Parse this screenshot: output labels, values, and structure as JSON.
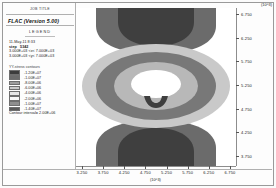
{
  "window": {
    "job_title": "JOB TITLE",
    "app_title": "FLAC (Version 5.00)"
  },
  "legend": {
    "heading": "LEGEND",
    "date": "11-May-11   8:33",
    "step_label": "step",
    "step_value": "5342",
    "xrange": "3.000E+03 <x<  7.000E+03",
    "yrange": "3.000E+03 <y<  7.000E+03",
    "colorbar_title": "YY-stress contours",
    "contour_interval": "Contour interval=  2.00E+06",
    "swatches": [
      {
        "color": "#3c3c3c",
        "label": "-1.20E+07"
      },
      {
        "color": "#6b6b6b",
        "label": "-1.00E+07"
      },
      {
        "color": "#9d9d9d",
        "label": "-8.00E+06"
      },
      {
        "color": "#c9c9c9",
        "label": "-6.00E+06"
      },
      {
        "color": "#e6e6e6",
        "label": "-4.00E+06"
      },
      {
        "color": "#f8f8f8",
        "label": "-2.00E+06"
      },
      {
        "color": "#8e8e8e",
        "label": "-1.00E+07"
      },
      {
        "color": "#5a5a5a",
        "label": "-1.40E+07"
      }
    ]
  },
  "chart_data": {
    "type": "heatmap",
    "title": "FLAC (Version 5.00)",
    "subtitle": "YY-stress contours",
    "xlabel": "",
    "ylabel": "",
    "x_multiplier": "(10^3)",
    "y_multiplier": "(10^3)",
    "xlim": [
      3.0,
      7.0
    ],
    "ylim": [
      3.5,
      7.0
    ],
    "xticks": [
      "3.250",
      "3.750",
      "4.250",
      "4.750",
      "5.250",
      "5.750",
      "6.250",
      "6.750"
    ],
    "yticks": [
      "6.750",
      "6.250",
      "5.750",
      "5.250",
      "4.750",
      "4.250",
      "3.750"
    ],
    "xtick_values": [
      3.25,
      3.75,
      4.25,
      4.75,
      5.25,
      5.75,
      6.25,
      6.75
    ],
    "ytick_values": [
      6.75,
      6.25,
      5.75,
      5.25,
      4.75,
      4.25,
      3.75
    ],
    "grid": false,
    "legend_position": "left-panel",
    "contour_interval": 2000000,
    "contour_levels": [
      -14000000,
      -12000000,
      -10000000,
      -8000000,
      -6000000,
      -4000000,
      -2000000
    ],
    "level_colors": [
      "#5a5a5a",
      "#3c3c3c",
      "#6b6b6b",
      "#9d9d9d",
      "#c9c9c9",
      "#e6e6e6",
      "#ffffff"
    ]
  }
}
